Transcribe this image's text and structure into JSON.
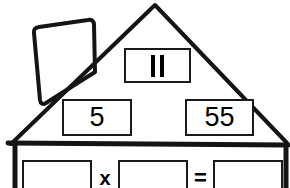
{
  "worksheet": {
    "title": "Fact Family House",
    "shape": "house-with-chimney",
    "ink_color": "#1a1a1a",
    "background_color": "#ffffff"
  },
  "roof": {
    "top_cell": {
      "name": "product-cell",
      "value": "II",
      "symbol_meaning": "rotated-equals",
      "filled": true
    },
    "middle_cells": [
      {
        "name": "factor-cell-left",
        "value": "5",
        "filled": true
      },
      {
        "name": "factor-cell-right",
        "value": "55",
        "filled": true
      }
    ]
  },
  "wall": {
    "equation": {
      "operand_1": "",
      "operator_1": "x",
      "operand_2": "",
      "operator_2": "=",
      "result": ""
    },
    "cells": [
      {
        "name": "equation-operand-1",
        "value": "",
        "filled": false
      },
      {
        "name": "equation-operand-2",
        "value": "",
        "filled": false
      },
      {
        "name": "equation-result",
        "value": "",
        "filled": false
      }
    ],
    "operators": [
      {
        "name": "multiplication-symbol",
        "value": "x"
      },
      {
        "name": "equals-symbol",
        "value": "="
      }
    ]
  }
}
